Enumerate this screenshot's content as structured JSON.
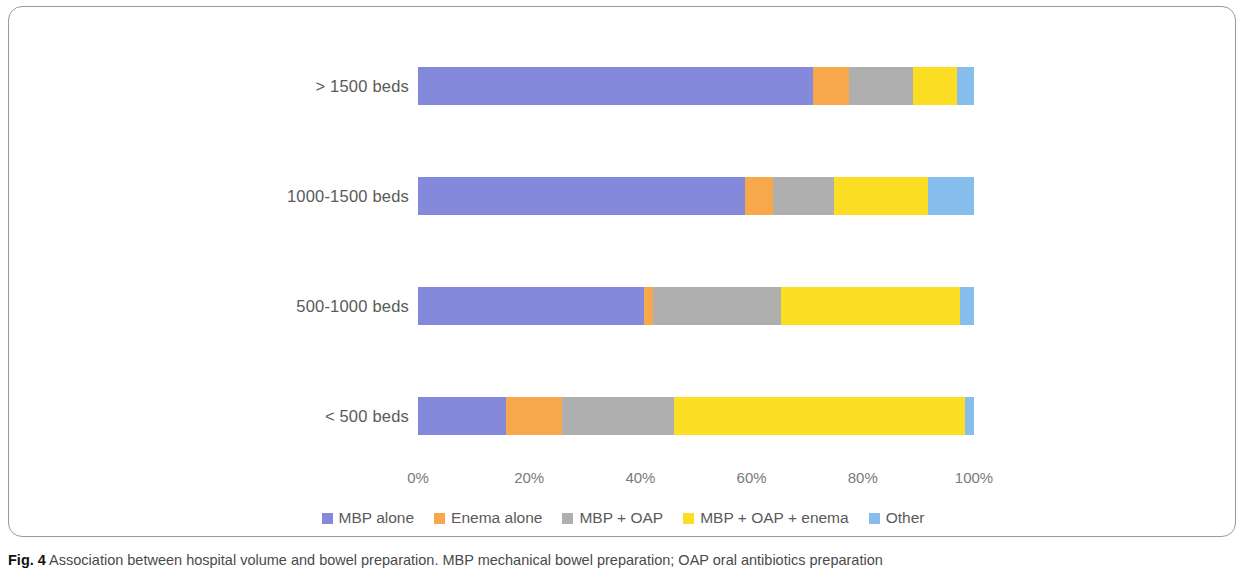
{
  "caption": {
    "label": "Fig. 4",
    "text": "Association between hospital volume and bowel preparation. MBP mechanical bowel preparation; OAP oral antibiotics preparation"
  },
  "axis": {
    "ticks": [
      "0%",
      "20%",
      "40%",
      "60%",
      "80%",
      "100%"
    ]
  },
  "legend": {
    "items": [
      {
        "label": "MBP alone",
        "color": "#8589DC"
      },
      {
        "label": "Enema alone",
        "color": "#F7A84A"
      },
      {
        "label": "MBP + OAP",
        "color": "#AFAFAF"
      },
      {
        "label": "MBP + OAP + enema",
        "color": "#FBDD24"
      },
      {
        "label": "Other",
        "color": "#86BDEC"
      }
    ]
  },
  "chart_data": {
    "type": "bar",
    "orientation": "horizontal",
    "stacked": true,
    "normalized": true,
    "title": "",
    "xlabel": "",
    "ylabel": "",
    "xlim": [
      0,
      100
    ],
    "grid": false,
    "legend_position": "bottom",
    "categories": [
      "> 1500 beds",
      "1000-1500 beds",
      "500-1000 beds",
      "< 500 beds"
    ],
    "series": [
      {
        "name": "MBP alone",
        "color": "#8589DC",
        "values": [
          71.0,
          58.8,
          40.6,
          15.8
        ]
      },
      {
        "name": "Enema alone",
        "color": "#F7A84A",
        "values": [
          6.5,
          5.0,
          1.7,
          10.1
        ]
      },
      {
        "name": "MBP + OAP",
        "color": "#AFAFAF",
        "values": [
          11.5,
          11.0,
          23.0,
          20.1
        ]
      },
      {
        "name": "MBP + OAP + enema",
        "color": "#FBDD24",
        "values": [
          8.0,
          16.9,
          32.2,
          52.4
        ]
      },
      {
        "name": "Other",
        "color": "#86BDEC",
        "values": [
          3.0,
          8.3,
          2.5,
          1.6
        ]
      }
    ]
  }
}
